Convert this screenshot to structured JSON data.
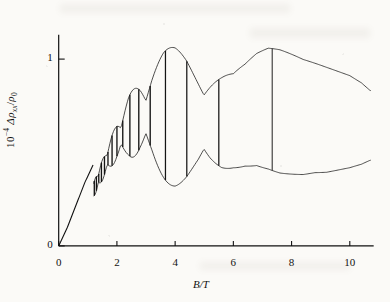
{
  "chart_data": {
    "type": "line",
    "title": "",
    "subtitle": "",
    "xlabel": "B/T",
    "ylabel": "10^-4 Δρxx/ρ0",
    "ylabel_parts": {
      "prefix_base": "10",
      "prefix_exp": "−4",
      "delta_rho": "Δρ",
      "rho_sub": "xx",
      "slash": "/",
      "rho0_base": "ρ",
      "rho0_sub": "0"
    },
    "xlim": [
      -0.35,
      10.9
    ],
    "ylim": [
      -0.03,
      1.22
    ],
    "xticks": [
      0,
      2,
      4,
      6,
      8,
      10
    ],
    "xticklabels": [
      "0",
      "2",
      "4",
      "6",
      "8",
      "10"
    ],
    "yticks": [
      0,
      1
    ],
    "yticklabels": [
      "0",
      "1"
    ],
    "grid": false,
    "legend": null,
    "tick_direction": "in",
    "spines": [
      "left",
      "bottom"
    ],
    "line_color": "#0d0d0d",
    "background_color": "#fbfaf7",
    "series": [
      {
        "name": "Δρxx/ρ0 vs B",
        "description": "Shubnikov–de Haas oscillations with beating envelope; amplitude rises from zero near B=0, oscillation onset near B≈1.2 T, envelope peaks near B≈4.5 T and again near B≈7 T, oscillation frequency increases with B.",
        "envelope_x": [
          0.0,
          0.4,
          0.8,
          1.2,
          1.6,
          2.0,
          2.4,
          2.8,
          3.2,
          3.6,
          4.0,
          4.4,
          4.8,
          5.2,
          5.6,
          6.0,
          6.4,
          6.8,
          7.2,
          7.6,
          8.0,
          8.4,
          8.8,
          9.2,
          9.6,
          10.0,
          10.4,
          10.7
        ],
        "envelope_upper": [
          0.0,
          0.06,
          0.18,
          0.34,
          0.5,
          0.66,
          0.8,
          0.9,
          0.98,
          1.04,
          1.08,
          1.1,
          1.09,
          1.06,
          1.02,
          0.98,
          1.0,
          1.04,
          1.06,
          1.05,
          1.03,
          1.01,
          1.0,
          0.99,
          0.98,
          0.97,
          0.94,
          0.9
        ],
        "envelope_lower": [
          0.0,
          0.04,
          0.13,
          0.26,
          0.38,
          0.46,
          0.48,
          0.46,
          0.42,
          0.36,
          0.3,
          0.26,
          0.24,
          0.26,
          0.3,
          0.36,
          0.4,
          0.42,
          0.41,
          0.39,
          0.38,
          0.37,
          0.37,
          0.36,
          0.36,
          0.36,
          0.37,
          0.39
        ],
        "baseline_x": [
          0.0,
          0.3,
          0.6,
          0.9,
          1.2
        ],
        "baseline_y": [
          0.0,
          0.1,
          0.22,
          0.34,
          0.44
        ],
        "osc_onset_B": 1.2,
        "osc_frequency_T": 11.0,
        "beat_frequency_T": 0.72,
        "beat_nodes_B": [
          3.0,
          5.9,
          8.2
        ],
        "peak_envelope_B": 4.4,
        "peak_envelope_value": 1.1
      }
    ]
  },
  "ticks": {
    "x": [
      {
        "value": 0,
        "label": "0"
      },
      {
        "value": 2,
        "label": "2"
      },
      {
        "value": 4,
        "label": "4"
      },
      {
        "value": 6,
        "label": "6"
      },
      {
        "value": 8,
        "label": "8"
      },
      {
        "value": 10,
        "label": "10"
      }
    ],
    "y": [
      {
        "value": 0,
        "label": "0"
      },
      {
        "value": 1,
        "label": "1"
      }
    ]
  }
}
